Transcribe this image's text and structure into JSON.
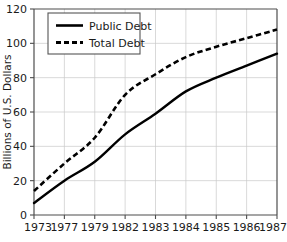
{
  "chart_data": {
    "type": "line",
    "title": "",
    "xlabel": "",
    "ylabel": "Billions of U.S. Dollars",
    "categories": [
      "1973",
      "1977",
      "1979",
      "1982",
      "1983",
      "1984",
      "1985",
      "1986",
      "1987"
    ],
    "series": [
      {
        "name": "Public Debt",
        "style": "solid",
        "color": "#000000",
        "values": [
          7,
          20,
          31,
          47,
          59,
          72,
          80,
          87,
          94
        ]
      },
      {
        "name": "Total Debt",
        "style": "dashed",
        "color": "#000000",
        "values": [
          14,
          30,
          45,
          70,
          82,
          92,
          98,
          103,
          108
        ]
      }
    ],
    "ylim": [
      0,
      120
    ],
    "yticks": [
      0,
      20,
      40,
      60,
      80,
      100,
      120
    ],
    "ytick_labels": [
      "0",
      "20",
      "40",
      "60",
      "80",
      "100",
      "120"
    ],
    "grid": true,
    "legend_position": "upper-left"
  },
  "axes": {
    "y_axis_title": "Billions of U.S. Dollars",
    "y_tick_0": "0",
    "y_tick_20": "20",
    "y_tick_40": "40",
    "y_tick_60": "60",
    "y_tick_80": "80",
    "y_tick_100": "100",
    "y_tick_120": "120",
    "x_tick_1": "1973",
    "x_tick_2": "1977",
    "x_tick_3": "1979",
    "x_tick_4": "1982",
    "x_tick_5": "1983",
    "x_tick_6": "1984",
    "x_tick_7": "1985",
    "x_tick_8": "1986",
    "x_tick_9": "1987"
  },
  "legend": {
    "entry_1_label": "Public Debt",
    "entry_2_label": "Total Debt"
  },
  "colors": {
    "line": "#000000",
    "grid": "#c8c8c8",
    "axis": "#4d4d4d",
    "background": "#ffffff"
  }
}
